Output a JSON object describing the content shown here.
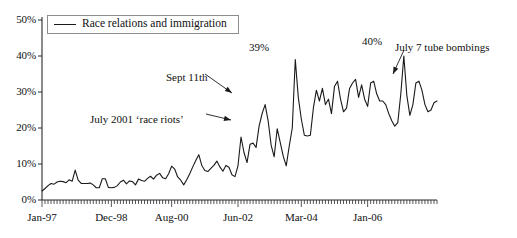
{
  "chart_data": {
    "type": "line",
    "title": "",
    "xlabel": "",
    "ylabel": "",
    "ylim": [
      0,
      50
    ],
    "grid": false,
    "legend_position": "top-left",
    "ytick_labels": [
      "50%",
      "40%",
      "30%",
      "20%",
      "10%",
      "0%"
    ],
    "ytick_values": [
      50,
      40,
      30,
      20,
      10,
      0
    ],
    "xtick_labels": [
      "Jan-97",
      "Dec-98",
      "Aug-00",
      "Jun-02",
      "Mar-04",
      "Jan-06"
    ],
    "xtick_index": [
      0,
      23,
      43,
      65,
      86,
      108
    ],
    "minor_tick_interval_months": 1,
    "x_start": "Jan-97",
    "x_end": "Dec-06",
    "series": [
      {
        "name": "Race relations and immigration",
        "color": "#1a1a1a",
        "values": [
          2.5,
          3.2,
          4.0,
          4.6,
          4.4,
          5.0,
          5.2,
          5.1,
          4.8,
          5.6,
          5.2,
          8.3,
          5.5,
          4.6,
          4.6,
          4.6,
          4.7,
          4.2,
          3.4,
          3.4,
          5.9,
          5.9,
          3.5,
          3.4,
          3.5,
          4.0,
          5.0,
          5.5,
          4.5,
          5.3,
          5.1,
          4.2,
          5.8,
          5.4,
          5.2,
          6.0,
          6.6,
          5.8,
          6.9,
          7.4,
          6.2,
          5.9,
          7.3,
          9.4,
          8.6,
          6.4,
          5.5,
          4.2,
          5.6,
          7.3,
          9.2,
          11.0,
          12.6,
          9.6,
          8.2,
          7.9,
          8.8,
          9.6,
          10.8,
          9.2,
          8.0,
          9.6,
          9.1,
          7.0,
          6.5,
          9.5,
          17.5,
          13.2,
          10.4,
          15.5,
          15.8,
          14.6,
          20.5,
          24.0,
          26.5,
          22.0,
          15.2,
          12.0,
          19.8,
          16.0,
          12.2,
          9.5,
          15.0,
          20.0,
          39.0,
          28.5,
          22.5,
          18.0,
          17.8,
          18.0,
          25.5,
          30.5,
          27.5,
          31.0,
          26.5,
          28.0,
          24.0,
          31.5,
          33.0,
          28.0,
          24.5,
          25.5,
          31.0,
          32.5,
          33.5,
          28.5,
          32.0,
          28.0,
          26.0,
          32.5,
          33.0,
          29.5,
          27.5,
          27.5,
          26.5,
          24.0,
          22.0,
          20.5,
          21.5,
          29.5,
          40.0,
          29.0,
          23.5,
          26.5,
          32.5,
          33.0,
          30.5,
          26.5,
          24.5,
          25.0,
          27.0,
          27.5
        ]
      }
    ],
    "annotations": [
      {
        "name": "sept-11th",
        "text": "Sept 11th",
        "text_x": 166,
        "text_y": 72,
        "arrow_from_x": 205,
        "arrow_from_y": 74,
        "arrow_to_x": 232,
        "arrow_to_y": 93
      },
      {
        "name": "july-2001-race-riots",
        "text": "July 2001 ‘race riots’",
        "text_x": 90,
        "text_y": 114,
        "arrow_from_x": 206,
        "arrow_from_y": 114,
        "arrow_to_x": 231,
        "arrow_to_y": 120
      },
      {
        "name": "july-7-tube-bombings",
        "text": "July 7 tube bombings",
        "text_x": 395,
        "text_y": 42,
        "arrow_from_x": 404,
        "arrow_from_y": 50,
        "arrow_to_x": 393,
        "arrow_to_y": 74
      }
    ],
    "point_labels": [
      {
        "name": "peak-39",
        "text": "39%",
        "x": 249,
        "y": 42
      },
      {
        "name": "peak-40",
        "text": "40%",
        "x": 362,
        "y": 36
      }
    ]
  },
  "legend": {
    "items": [
      {
        "label": "Race relations and immigration",
        "color": "#1a1a1a"
      }
    ]
  },
  "axes": {
    "y": {
      "ticks": [
        {
          "label": "50%",
          "value": 50
        },
        {
          "label": "40%",
          "value": 40
        },
        {
          "label": "30%",
          "value": 30
        },
        {
          "label": "20%",
          "value": 20
        },
        {
          "label": "10%",
          "value": 10
        },
        {
          "label": "0%",
          "value": 0
        }
      ]
    },
    "x": {
      "ticks": [
        {
          "label": "Jan-97",
          "index": 0
        },
        {
          "label": "Dec-98",
          "index": 23
        },
        {
          "label": "Aug-00",
          "index": 43
        },
        {
          "label": "Jun-02",
          "index": 65
        },
        {
          "label": "Mar-04",
          "index": 86
        },
        {
          "label": "Jan-06",
          "index": 108
        }
      ]
    }
  },
  "colors": {
    "line": "#1a1a1a",
    "axis": "#2b2b2b",
    "legend_border": "#8d8d8d",
    "background": "#ffffff",
    "text": "#111111"
  }
}
